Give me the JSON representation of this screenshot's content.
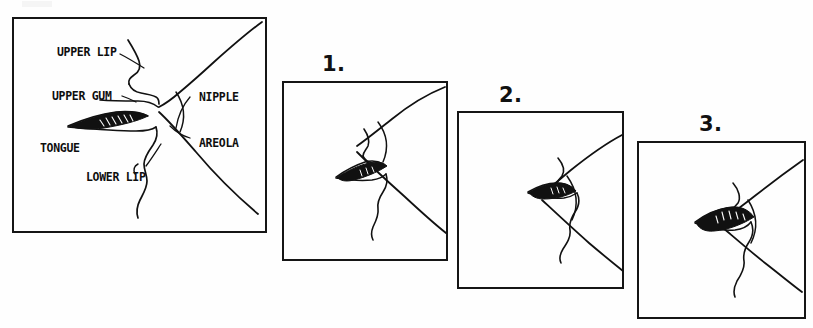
{
  "document": {
    "type": "hand-drawn instructional diagram",
    "title_visible": false,
    "background_color": "#fefefe",
    "ink_color": "#111111"
  },
  "main_panel": {
    "name": "labeled-latch-cross-section",
    "frame": {
      "x": 12,
      "y": 17,
      "width": 255,
      "height": 216
    },
    "labels": [
      {
        "key": "upper_lip",
        "text": "UPPER LIP",
        "x": 57,
        "y": 47
      },
      {
        "key": "upper_gum",
        "text": "UPPER GUM",
        "x": 52,
        "y": 91
      },
      {
        "key": "nipple",
        "text": "NIPPLE",
        "x": 199,
        "y": 92
      },
      {
        "key": "tongue",
        "text": "TONGUE",
        "x": 40,
        "y": 143
      },
      {
        "key": "areola",
        "text": "AREOLA",
        "x": 199,
        "y": 138
      },
      {
        "key": "lower_lip",
        "text": "LOWER LIP",
        "x": 86,
        "y": 172
      }
    ]
  },
  "sequence_panels": [
    {
      "number": "1.",
      "number_x": 322,
      "number_y": 54,
      "number_size": 21,
      "frame": {
        "x": 282,
        "y": 81,
        "width": 166,
        "height": 180
      },
      "caption_key": "step-1"
    },
    {
      "number": "2.",
      "number_x": 499,
      "number_y": 85,
      "number_size": 21,
      "frame": {
        "x": 457,
        "y": 111,
        "width": 167,
        "height": 178
      },
      "caption_key": "step-2"
    },
    {
      "number": "3.",
      "number_x": 699,
      "number_y": 114,
      "number_size": 21,
      "frame": {
        "x": 637,
        "y": 141,
        "width": 169,
        "height": 178
      },
      "caption_key": "step-3"
    }
  ]
}
